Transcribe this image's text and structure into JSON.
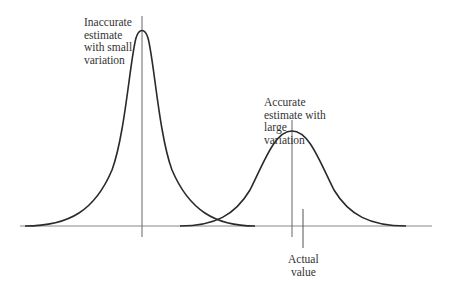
{
  "diagram": {
    "labels": {
      "inaccurate": "Inaccurate\nestimate\nwith small\nvariation",
      "accurate": "Accurate\nestimate with\nlarge\nvariation",
      "actual": "Actual\nvalue"
    },
    "colors": {
      "curve": "#2a2a2a",
      "axis": "#777777",
      "text": "#333333"
    },
    "curves": [
      {
        "name": "narrow",
        "center_x": 142,
        "peak_y": 28,
        "description": "tall narrow distribution"
      },
      {
        "name": "wide",
        "center_x": 292,
        "peak_y": 131,
        "description": "short wide distribution"
      }
    ],
    "actual_value_x": 303
  }
}
